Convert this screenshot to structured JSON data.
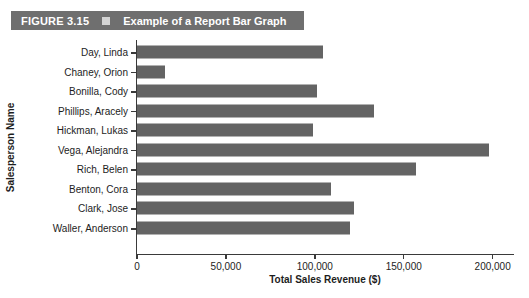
{
  "figure": {
    "number_label": "FIGURE 3.15",
    "marker_icon": "square-marker-icon",
    "title": "Example of a Report Bar Graph",
    "bar_background_color": "#6f6f6f",
    "marker_color": "#d4d4d4"
  },
  "chart_data": {
    "type": "bar",
    "orientation": "horizontal",
    "title": "Example of a Report Bar Graph",
    "xlabel": "Total Sales Revenue ($)",
    "ylabel": "Salesperson Name",
    "xlim": [
      0,
      212000
    ],
    "xticks": [
      0,
      50000,
      100000,
      150000,
      200000
    ],
    "xticklabels": [
      "0",
      "50,000",
      "100,000",
      "150,000",
      "200,000"
    ],
    "grid": false,
    "legend": false,
    "bar_color": "#646464",
    "categories": [
      "Day, Linda",
      "Chaney, Orion",
      "Bonilla, Cody",
      "Phillips, Aracely",
      "Hickman, Lukas",
      "Vega, Alejandra",
      "Rich, Belen",
      "Benton, Cora",
      "Clark, Jose",
      "Waller, Anderson"
    ],
    "values": [
      104500,
      15700,
      101000,
      133000,
      99000,
      198000,
      157000,
      109000,
      122000,
      120000
    ]
  }
}
